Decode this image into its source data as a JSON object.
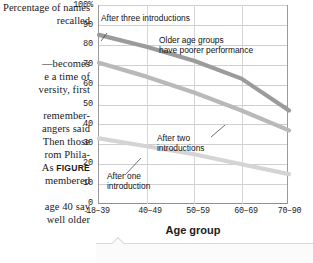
{
  "body_text": {
    "lines": [
      {
        "text": "—becomes",
        "align": "r",
        "top": 58
      },
      {
        "text": "e a time of",
        "align": "r",
        "top": 71
      },
      {
        "text": "versity, first",
        "align": "r",
        "top": 84
      },
      {
        "text": "remember-",
        "align": "r",
        "top": 110
      },
      {
        "text": "angers said",
        "align": "r",
        "top": 123
      },
      {
        "text": "Then those",
        "align": "r",
        "top": 136
      },
      {
        "text": "rom Phila-",
        "align": "r",
        "top": 149
      },
      {
        "text": "As FIGURE",
        "align": "r",
        "top": 162,
        "bold_tail": "FIGURE"
      },
      {
        "text": "membered",
        "align": "r",
        "top": 175
      },
      {
        "text": "age 40 say",
        "align": "r",
        "top": 201
      },
      {
        "text": "well older",
        "align": "r",
        "top": 214
      },
      {
        "text": "y Park.",
        "align": "r",
        "top": 227
      }
    ]
  },
  "chart_data": {
    "type": "line",
    "title": "",
    "ylabel": "Percentage of names recalled",
    "xlabel": "Age group",
    "categories": [
      "18–39",
      "40–49",
      "50–59",
      "60–69",
      "70–90"
    ],
    "ylim": [
      0,
      100
    ],
    "yticks": [
      "100%",
      "90",
      "80",
      "70",
      "60",
      "50",
      "40",
      "30",
      "20",
      "10",
      "0"
    ],
    "ytick_values": [
      100,
      90,
      80,
      70,
      60,
      50,
      40,
      30,
      20,
      10,
      0
    ],
    "grid": true,
    "legend": "none",
    "series": [
      {
        "name": "After three introductions",
        "color": "#9b9b9b",
        "values": [
          85,
          79,
          72,
          63,
          47
        ]
      },
      {
        "name": "After two introductions",
        "color": "#b9b9b9",
        "values": [
          71,
          64,
          56,
          47,
          37
        ]
      },
      {
        "name": "After one introduction",
        "color": "#d4d4d4",
        "values": [
          33,
          29,
          25,
          20,
          15
        ]
      }
    ],
    "annotations": [
      {
        "name": "after-three-introductions",
        "text": "After three introductions"
      },
      {
        "name": "older-age-groups-note",
        "text": "Older age groups\nhave poorer performance"
      },
      {
        "name": "after-two-introductions",
        "text": "After two\nintroductions"
      },
      {
        "name": "after-one-introduction",
        "text": "After one\nintroduction"
      }
    ]
  }
}
